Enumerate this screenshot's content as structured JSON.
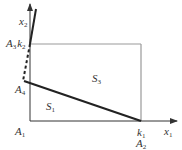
{
  "diagram": {
    "axes": {
      "horizontal": {
        "label": "x",
        "sub": "1"
      },
      "vertical": {
        "label": "x",
        "sub": "2"
      }
    },
    "points": {
      "A1": {
        "label": "A",
        "sub": "1"
      },
      "A2": {
        "label": "A",
        "sub": "2"
      },
      "k1": {
        "label": "k",
        "sub": "1"
      },
      "A3": {
        "label": "A",
        "sub": "3"
      },
      "k2": {
        "label": "k",
        "sub": "2"
      },
      "A4": {
        "label": "A",
        "sub": "4"
      }
    },
    "regions": {
      "S1": {
        "label": "S",
        "sub": "1"
      },
      "S3": {
        "label": "S",
        "sub": "3"
      }
    },
    "colors": {
      "axis": "#333333",
      "rect": "#999999",
      "thick_line": "#222222"
    }
  }
}
